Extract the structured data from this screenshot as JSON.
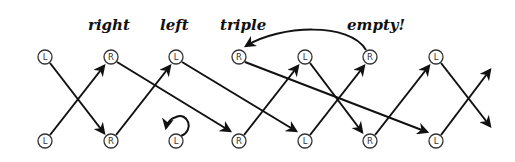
{
  "diagram": {
    "labels": [
      {
        "id": "right",
        "text": "right",
        "x": 88,
        "y": 30
      },
      {
        "id": "left",
        "text": "left",
        "x": 160,
        "y": 30
      },
      {
        "id": "triple",
        "text": "triple",
        "x": 220,
        "y": 30
      },
      {
        "id": "empty",
        "text": "empty!",
        "x": 347,
        "y": 30
      }
    ],
    "top_nodes": [
      {
        "id": "t0",
        "label": "L",
        "x": 45,
        "y": 57
      },
      {
        "id": "t1",
        "label": "R",
        "x": 111,
        "y": 57
      },
      {
        "id": "t2",
        "label": "L",
        "x": 176,
        "y": 57
      },
      {
        "id": "t3",
        "label": "R",
        "x": 239,
        "y": 57
      },
      {
        "id": "t4",
        "label": "L",
        "x": 305,
        "y": 57
      },
      {
        "id": "t5",
        "label": "R",
        "x": 370,
        "y": 57
      },
      {
        "id": "t6",
        "label": "L",
        "x": 436,
        "y": 57
      }
    ],
    "bottom_nodes": [
      {
        "id": "b0",
        "label": "L",
        "x": 45,
        "y": 141
      },
      {
        "id": "b1",
        "label": "R",
        "x": 111,
        "y": 141
      },
      {
        "id": "b2",
        "label": "L",
        "x": 176,
        "y": 141
      },
      {
        "id": "b3",
        "label": "R",
        "x": 239,
        "y": 141
      },
      {
        "id": "b4",
        "label": "L",
        "x": 305,
        "y": 141
      },
      {
        "id": "b5",
        "label": "R",
        "x": 370,
        "y": 141
      },
      {
        "id": "b6",
        "label": "L",
        "x": 436,
        "y": 141
      }
    ],
    "edges": [
      {
        "from": "t0",
        "to": "b1"
      },
      {
        "from": "b0",
        "to": "t1"
      },
      {
        "from": "t1",
        "to": "b3"
      },
      {
        "from": "b1",
        "to": "t2"
      },
      {
        "from": "t2",
        "to": "b4"
      },
      {
        "from": "b3",
        "to": "t4"
      },
      {
        "from": "t3",
        "to": "b6"
      },
      {
        "from": "t4",
        "to": "b5"
      },
      {
        "from": "b4",
        "to": "t5"
      },
      {
        "from": "b5",
        "to": "t6"
      },
      {
        "from": "t6",
        "to": "out-down"
      },
      {
        "from": "b6",
        "to": "out-up"
      },
      {
        "from": "t5",
        "to": "t3",
        "curved": true
      },
      {
        "from": "b2",
        "to": "b2",
        "self_loop": true
      }
    ]
  }
}
